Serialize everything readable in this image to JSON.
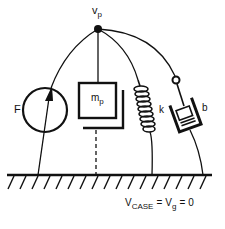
{
  "diagram": {
    "type": "mechanical-impedance-network",
    "node": {
      "label": "v",
      "subscript": "p"
    },
    "elements": [
      {
        "id": "force-source",
        "label": "F",
        "subscript": ""
      },
      {
        "id": "mass",
        "label": "m",
        "subscript": "p"
      },
      {
        "id": "spring",
        "label": "k",
        "subscript": ""
      },
      {
        "id": "damper",
        "label": "b",
        "subscript": ""
      }
    ],
    "ground_equation": {
      "v1": "V",
      "v1_sub": "CASE",
      "eq1": "=",
      "v2": "V",
      "v2_sub": "g",
      "eq2": "=",
      "value": "0"
    },
    "colors": {
      "stroke": "#111111",
      "background": "#ffffff"
    }
  }
}
